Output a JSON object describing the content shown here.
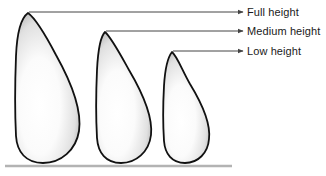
{
  "figure": {
    "background_color": "#ffffff",
    "baseline": {
      "name": "ground-line",
      "color": "#b3b3b3",
      "x1": 5,
      "y1": 166,
      "x2": 232,
      "y2": 166
    },
    "shape_style": {
      "outline_color": "#111111",
      "outline_width": 1.8,
      "fill_light": "#ffffff",
      "fill_mid": "#f2f2f2",
      "fill_edge": "#a8a8a8",
      "fill_description": "light gray to white radial gradient"
    },
    "leader_style": {
      "color": "#444444",
      "width": 1
    },
    "callouts": [
      {
        "id": "full",
        "label": "Full height",
        "leader_y": 12,
        "leader_x_start": 29,
        "leader_x_end": 243,
        "label_x": 247,
        "label_y": 6
      },
      {
        "id": "medium",
        "label": "Medium height",
        "leader_y": 31,
        "leader_x_start": 106,
        "leader_x_end": 243,
        "label_x": 247,
        "label_y": 25
      },
      {
        "id": "low",
        "label": "Low height",
        "leader_y": 51,
        "leader_x_start": 173,
        "leader_x_end": 243,
        "label_x": 247,
        "label_y": 45
      }
    ],
    "shapes": [
      {
        "id": "full",
        "name": "Full height",
        "apex_x": 28,
        "apex_y": 12,
        "base_y": 163,
        "left_x": 16,
        "right_x": 80,
        "height_px": 151,
        "path": "M 28 13 C 21 18 17 32 16 56 C 15 82 15 116 16 136 C 17 152 26 163 43 163 C 61 163 76 150 79 131 C 82 110 70 80 56 55 C 45 34 35 18 28 13 Z"
      },
      {
        "id": "medium",
        "name": "Medium height",
        "apex_x": 105,
        "apex_y": 31,
        "base_y": 163,
        "left_x": 97,
        "right_x": 152,
        "height_px": 132,
        "path": "M 105 32 C 100 37 98 50 97 70 C 96 92 96 120 97 138 C 98 153 106 163 121 163 C 136 163 149 152 151 135 C 153 117 142 92 129 70 C 119 52 111 37 105 32 Z"
      },
      {
        "id": "low",
        "name": "Low height",
        "apex_x": 172,
        "apex_y": 51,
        "base_y": 163,
        "left_x": 164,
        "right_x": 210,
        "height_px": 112,
        "path": "M 172 52 C 168 57 165 69 164 86 C 163 104 163 126 164 141 C 165 154 172 163 185 163 C 198 163 208 153 209 139 C 211 123 201 102 190 84 C 182 70 177 56 172 52 Z"
      }
    ]
  }
}
